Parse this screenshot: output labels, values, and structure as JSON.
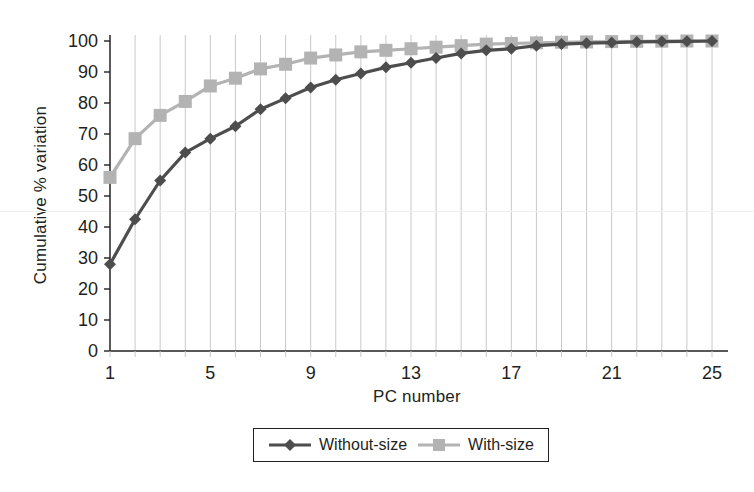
{
  "chart_data": {
    "type": "line",
    "title": "",
    "xlabel": "PC number",
    "ylabel": "Cumulative % variation",
    "x": [
      1,
      2,
      3,
      4,
      5,
      6,
      7,
      8,
      9,
      10,
      11,
      12,
      13,
      14,
      15,
      16,
      17,
      18,
      19,
      20,
      21,
      22,
      23,
      24,
      25
    ],
    "xlim": [
      1,
      25
    ],
    "ylim": [
      0,
      100
    ],
    "x_tick_labels": [
      "1",
      "5",
      "9",
      "13",
      "17",
      "21",
      "25"
    ],
    "x_tick_values": [
      1,
      5,
      9,
      13,
      17,
      21,
      25
    ],
    "x_minor_ticks": [
      1,
      2,
      3,
      4,
      5,
      6,
      7,
      8,
      9,
      10,
      11,
      12,
      13,
      14,
      15,
      16,
      17,
      18,
      19,
      20,
      21,
      22,
      23,
      24,
      25
    ],
    "y_tick_labels": [
      "0",
      "10",
      "20",
      "30",
      "40",
      "50",
      "60",
      "70",
      "80",
      "90",
      "100"
    ],
    "y_tick_values": [
      0,
      10,
      20,
      30,
      40,
      50,
      60,
      70,
      80,
      90,
      100
    ],
    "grid": "vertical",
    "legend_position": "bottom-center",
    "series": [
      {
        "name": "Without-size",
        "color": "#4d4d4d",
        "marker": "diamond",
        "values": [
          28,
          42.5,
          55,
          64,
          68.5,
          72.5,
          78,
          81.5,
          85,
          87.5,
          89.5,
          91.5,
          93,
          94.5,
          96,
          97,
          97.5,
          98.5,
          99,
          99.3,
          99.5,
          99.7,
          99.8,
          99.9,
          100
        ]
      },
      {
        "name": "With-size",
        "color": "#b3b3b3",
        "marker": "square",
        "values": [
          56,
          68.5,
          76,
          80.5,
          85.5,
          88,
          91,
          92.5,
          94.5,
          95.5,
          96.5,
          97,
          97.5,
          98,
          98.5,
          99,
          99.2,
          99.4,
          99.6,
          99.7,
          99.8,
          99.9,
          99.95,
          100,
          100
        ]
      }
    ]
  },
  "axes": {
    "x_title": "PC number",
    "y_title": "Cumulative % variation"
  },
  "legend": {
    "entries": [
      {
        "label": "Without-size",
        "color": "#4d4d4d",
        "marker": "diamond"
      },
      {
        "label": "With-size",
        "color": "#b3b3b3",
        "marker": "square"
      }
    ]
  },
  "colors": {
    "without_size": "#4d4d4d",
    "with_size": "#b3b3b3",
    "axis": "#231f20",
    "grid": "#c8c8c8",
    "background": "#ffffff"
  }
}
